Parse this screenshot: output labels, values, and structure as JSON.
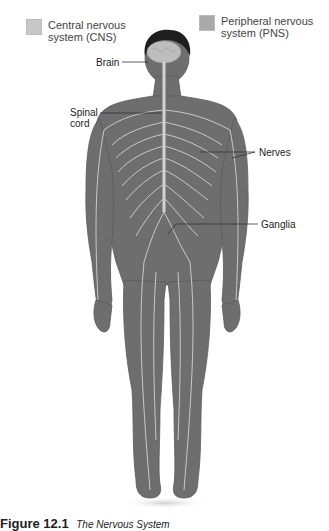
{
  "legend": [
    {
      "label_line1": "Central nervous",
      "label_line2": "system (CNS)",
      "color": "#c8c8c8"
    },
    {
      "label_line1": "Peripheral nervous",
      "label_line2": "system (PNS)",
      "color": "#a9a9a9"
    }
  ],
  "labels": {
    "brain": "Brain",
    "spinal_cord_line1": "Spinal",
    "spinal_cord_line2": "cord",
    "nerves": "Nerves",
    "ganglia": "Ganglia"
  },
  "caption": {
    "figure_number": "Figure 12.1",
    "title": "The Nervous System"
  },
  "colors": {
    "body": "#6e6e6e",
    "body_dark": "#555555",
    "nerve": "#c9c9c9",
    "hair": "#1e1e1e",
    "brain": "#bdbdbd"
  }
}
